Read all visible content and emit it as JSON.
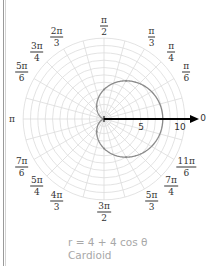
{
  "chart_data": {
    "type": "line",
    "coordinate_system": "polar",
    "title": "",
    "equation": "r = 4 + 4 cos θ",
    "curve_name": "Cardioid",
    "function": {
      "a": 4,
      "b": 4,
      "trig": "cos"
    },
    "radial_ticks": [
      5,
      10
    ],
    "radial_range": [
      0,
      11
    ],
    "grid": true,
    "grid_rings": 11,
    "angle_spokes_deg": 15,
    "polar_axis_label": "0",
    "angle_labels": [
      {
        "angle_deg": 90,
        "num": "π",
        "den": "2"
      },
      {
        "angle_deg": 60,
        "num": "π",
        "den": "3"
      },
      {
        "angle_deg": 45,
        "num": "π",
        "den": "4"
      },
      {
        "angle_deg": 30,
        "num": "π",
        "den": "6"
      },
      {
        "angle_deg": 120,
        "num": "2π",
        "den": "3"
      },
      {
        "angle_deg": 135,
        "num": "3π",
        "den": "4"
      },
      {
        "angle_deg": 150,
        "num": "5π",
        "den": "6"
      },
      {
        "angle_deg": 210,
        "num": "7π",
        "den": "6"
      },
      {
        "angle_deg": 225,
        "num": "5π",
        "den": "4"
      },
      {
        "angle_deg": 240,
        "num": "4π",
        "den": "3"
      },
      {
        "angle_deg": 270,
        "num": "3π",
        "den": "2"
      },
      {
        "angle_deg": 300,
        "num": "5π",
        "den": "3"
      },
      {
        "angle_deg": 315,
        "num": "7π",
        "den": "4"
      },
      {
        "angle_deg": 330,
        "num": "11π",
        "den": "6"
      }
    ],
    "pi_label": "π",
    "sample_points": [
      {
        "theta": "0",
        "r": 8
      },
      {
        "theta": "π/3",
        "r": 6
      },
      {
        "theta": "π/2",
        "r": 4
      },
      {
        "theta": "2π/3",
        "r": 2
      },
      {
        "theta": "π",
        "r": 0
      },
      {
        "theta": "4π/3",
        "r": 2
      },
      {
        "theta": "3π/2",
        "r": 4
      },
      {
        "theta": "5π/3",
        "r": 6
      }
    ],
    "colors": {
      "grid": "#dcdcdc",
      "curve": "#8a8a8a",
      "axis": "#000000",
      "caption": "#a8a8a8"
    }
  },
  "caption": {
    "equation": "r = 4 + 4 cos θ",
    "name": "Cardioid"
  },
  "labels": {
    "pi": "π",
    "zero": "0",
    "tick5": "5",
    "tick10": "10"
  }
}
